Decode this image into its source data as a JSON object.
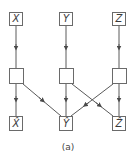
{
  "diagram": {
    "caption": "(a)",
    "colors": {
      "line": "#5a5a5a",
      "box_border": "#6a6a6a",
      "text": "#3a3a3a"
    },
    "top_row": [
      {
        "id": "x",
        "label": "X"
      },
      {
        "id": "y",
        "label": "Y"
      },
      {
        "id": "z",
        "label": "Z"
      }
    ],
    "middle_row": [
      {
        "id": "x-mid",
        "label": ""
      },
      {
        "id": "y-mid",
        "label": ""
      },
      {
        "id": "z-mid",
        "label": ""
      }
    ],
    "bottom_row": [
      {
        "id": "x-hat",
        "label": "X̂"
      },
      {
        "id": "y-hat",
        "label": "Ŷ"
      },
      {
        "id": "z-hat",
        "label": "Ẑ"
      }
    ],
    "edges": [
      {
        "from": "x",
        "to": "x-mid"
      },
      {
        "from": "y",
        "to": "y-mid"
      },
      {
        "from": "z",
        "to": "z-mid"
      },
      {
        "from": "x-mid",
        "to": "x-hat"
      },
      {
        "from": "x-mid",
        "to": "y-hat"
      },
      {
        "from": "y-mid",
        "to": "y-hat"
      },
      {
        "from": "y-mid",
        "to": "z-hat"
      },
      {
        "from": "z-mid",
        "to": "y-hat"
      },
      {
        "from": "z-mid",
        "to": "z-hat"
      }
    ]
  }
}
